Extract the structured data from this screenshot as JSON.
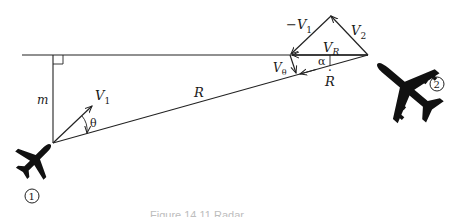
{
  "diagram": {
    "type": "vector-geometry",
    "labels": {
      "m": "m",
      "v1": "V",
      "v1_sub": "1",
      "theta": "θ",
      "r": "R",
      "neg_v1": "−V",
      "neg_v1_sub": "1",
      "v2": "V",
      "v2_sub": "2",
      "vr": "V",
      "vr_sub": "R",
      "vtheta": "V",
      "vtheta_sub": "θ",
      "alpha": "α",
      "rdot": "R",
      "rdot_mark": "·",
      "aircraft1": "1",
      "aircraft2": "2"
    },
    "caption": "Figure 14.11  Radar..."
  }
}
